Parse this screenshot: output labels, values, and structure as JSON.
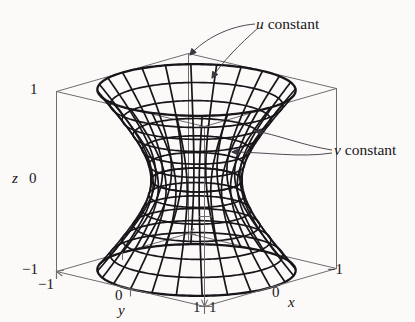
{
  "figure": {
    "kind": "3d-wireframe-surface",
    "background_color": "#fbfaf8",
    "ink_color": "#18161a",
    "box_line_color": "#6f6c70"
  },
  "annotations": {
    "u_constant": {
      "var": "u",
      "word": "constant"
    },
    "v_constant": {
      "var": "v",
      "word": "constant"
    }
  },
  "axes": {
    "z": {
      "name": "z",
      "ticks": [
        {
          "label": "1"
        },
        {
          "label": "0"
        },
        {
          "label": "−1"
        }
      ]
    },
    "y": {
      "name": "y",
      "ticks": [
        {
          "label": "−1"
        },
        {
          "label": "0"
        },
        {
          "label": "1"
        }
      ]
    },
    "x": {
      "name": "x",
      "ticks": [
        {
          "label": "1"
        },
        {
          "label": "0"
        },
        {
          "label": "−1"
        }
      ]
    }
  },
  "chart_data": {
    "type": "surface3d",
    "title": "",
    "surface": "hyperboloid of one sheet",
    "parametrization": "x = cosh(u) cos(v), y = cosh(u) sin(v), z = sinh(u)",
    "u_lines_label": "u constant",
    "v_lines_label": "v constant",
    "u_count": 13,
    "v_count": 24,
    "xlabel": "x",
    "ylabel": "y",
    "zlabel": "z",
    "xlim": [
      -1,
      1
    ],
    "ylim": [
      -1,
      1
    ],
    "zlim": [
      -1,
      1
    ],
    "xticks": [
      1,
      0,
      -1
    ],
    "yticks": [
      -1,
      0,
      1
    ],
    "zticks": [
      1,
      0,
      -1
    ],
    "grid": false,
    "legend": "none",
    "box": true
  }
}
